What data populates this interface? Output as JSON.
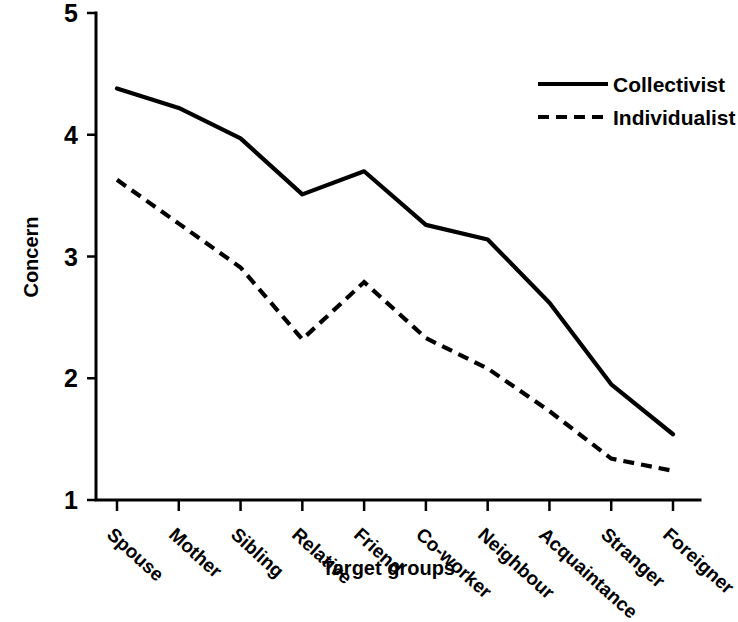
{
  "chart_data": {
    "type": "line",
    "title": "",
    "xlabel": "Target groups",
    "ylabel": "Concern",
    "ylim": [
      1,
      5
    ],
    "yticks": [
      1,
      2,
      3,
      4,
      5
    ],
    "grid": false,
    "legend_position": "top-right",
    "categories": [
      "Spouse",
      "Mother",
      "Sibling",
      "Relative",
      "Friend",
      "Co-worker",
      "Neighbour",
      "Acquaintance",
      "Stranger",
      "Foreigner"
    ],
    "series": [
      {
        "name": "Collectivist",
        "style": "solid",
        "color": "#000000",
        "values": [
          4.38,
          4.22,
          3.97,
          3.51,
          3.7,
          3.26,
          3.14,
          2.62,
          1.95,
          1.54
        ]
      },
      {
        "name": "Individualist",
        "style": "dashed",
        "color": "#000000",
        "values": [
          3.63,
          3.27,
          2.91,
          2.32,
          2.79,
          2.33,
          2.08,
          1.73,
          1.34,
          1.24
        ]
      }
    ]
  },
  "legend": {
    "items": [
      {
        "label": "Collectivist",
        "style": "solid"
      },
      {
        "label": "Individualist",
        "style": "dashed"
      }
    ]
  }
}
